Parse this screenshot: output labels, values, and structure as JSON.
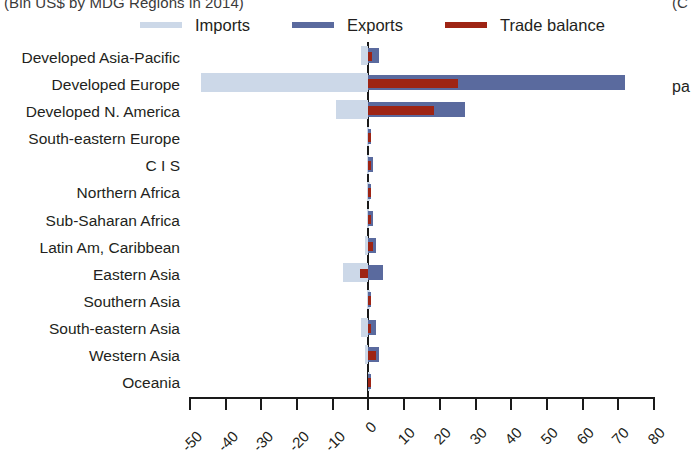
{
  "title": {
    "main": "(Bln US$ by MDG Regions in 2014)",
    "right_clipped": "(C"
  },
  "annotations": {
    "right_clipped_note": "pa"
  },
  "legend": {
    "position": "top",
    "items": [
      {
        "label": "Imports",
        "color": "#ccd8e8",
        "key": "imports"
      },
      {
        "label": "Exports",
        "color": "#5a6a9e",
        "key": "exports"
      },
      {
        "label": "Trade balance",
        "color": "#9e2414",
        "key": "balance"
      }
    ]
  },
  "chart_data": {
    "type": "bar",
    "orientation": "horizontal",
    "title": "(Bln US$ by MDG Regions in 2014)",
    "xlabel": "",
    "ylabel": "",
    "xlim": [
      -50,
      80
    ],
    "xticks": [
      -50,
      -40,
      -30,
      -20,
      -10,
      0,
      10,
      20,
      30,
      40,
      50,
      60,
      70,
      80
    ],
    "xticklabels": [
      "-50",
      "-40",
      "-30",
      "-20",
      "-10",
      "0",
      "10",
      "20",
      "30",
      "40",
      "50",
      "60",
      "70",
      "80"
    ],
    "grid": false,
    "categories": [
      "Developed Asia-Pacific",
      "Developed Europe",
      "Developed N. America",
      "South-eastern Europe",
      "C I S",
      "Northern Africa",
      "Sub-Saharan Africa",
      "Latin Am, Caribbean",
      "Eastern Asia",
      "Southern Asia",
      "South-eastern Asia",
      "Western Asia",
      "Oceania"
    ],
    "series": [
      {
        "name": "Imports",
        "color": "#ccd8e8",
        "values": [
          -2.0,
          -47.0,
          -9.0,
          -0.4,
          -0.5,
          -0.3,
          -0.5,
          -1.0,
          -7.0,
          -0.3,
          -2.0,
          -1.0,
          -0.2
        ]
      },
      {
        "name": "Exports",
        "color": "#5a6a9e",
        "values": [
          3.0,
          72.0,
          27.0,
          0.5,
          1.2,
          0.6,
          1.2,
          2.2,
          4.0,
          0.4,
          2.2,
          3.0,
          0.2
        ]
      },
      {
        "name": "Trade balance",
        "color": "#9e2414",
        "values": [
          1.0,
          25.0,
          18.5,
          0.2,
          0.8,
          0.4,
          0.8,
          1.4,
          -2.5,
          0.2,
          0.3,
          2.2,
          0.1
        ]
      }
    ]
  }
}
